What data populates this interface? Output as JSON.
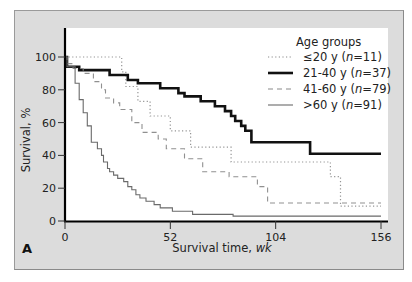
{
  "chart_data": {
    "type": "line",
    "subtype": "kaplan-meier step",
    "panel_label": "A",
    "title": "",
    "xlabel": "Survival time, ",
    "xlabel_unit": "wk",
    "ylabel": "Survival, %",
    "xlim": [
      0,
      156
    ],
    "ylim": [
      0,
      100
    ],
    "x_ticks": [
      0,
      52,
      104,
      156
    ],
    "y_ticks": [
      0,
      20,
      40,
      60,
      80,
      100
    ],
    "grid": false,
    "legend": {
      "title": "Age groups",
      "position": "upper right",
      "entries": [
        {
          "prefix": "≤20 y (",
          "n_label": "n",
          "suffix": "=11)",
          "style": "dotted"
        },
        {
          "prefix": "21-40 y (",
          "n_label": "n",
          "suffix": "=37)",
          "style": "thick-solid"
        },
        {
          "prefix": "41-60 y (",
          "n_label": "n",
          "suffix": "=79)",
          "style": "dashed"
        },
        {
          "prefix": ">60 y (",
          "n_label": "n",
          "suffix": "=91)",
          "style": "thin-solid"
        }
      ]
    },
    "series": [
      {
        "name": "≤20 y (n=11)",
        "style": "dotted",
        "color": "#8a8a8a",
        "x": [
          0,
          2,
          2,
          28,
          28,
          30,
          30,
          36,
          36,
          42,
          42,
          52,
          52,
          62,
          62,
          82,
          82,
          131,
          131,
          136,
          136,
          156
        ],
        "y": [
          100,
          100,
          100,
          100,
          91,
          91,
          82,
          82,
          73,
          73,
          64,
          64,
          55,
          55,
          45,
          45,
          36,
          36,
          27,
          27,
          9,
          9
        ]
      },
      {
        "name": "21-40 y (n=37)",
        "style": "thick-solid",
        "color": "#111111",
        "x": [
          0,
          1,
          1,
          7,
          7,
          22,
          22,
          31,
          31,
          36,
          36,
          47,
          47,
          56,
          56,
          59,
          59,
          67,
          67,
          74,
          74,
          79,
          79,
          82,
          82,
          84,
          84,
          87,
          87,
          89,
          89,
          92,
          92,
          106,
          106,
          121,
          121,
          156
        ],
        "y": [
          100,
          100,
          94,
          94,
          92,
          92,
          89,
          89,
          86,
          86,
          84,
          84,
          81,
          81,
          78,
          78,
          76,
          76,
          73,
          73,
          70,
          70,
          67,
          67,
          64,
          64,
          61,
          61,
          58,
          58,
          55,
          55,
          48,
          48,
          48,
          48,
          41,
          41
        ]
      },
      {
        "name": "41-60 y (n=79)",
        "style": "dashed",
        "color": "#8a8a8a",
        "x": [
          0,
          1,
          1,
          4,
          4,
          9,
          9,
          14,
          14,
          18,
          18,
          20,
          20,
          24,
          24,
          27,
          27,
          33,
          33,
          38,
          38,
          46,
          46,
          50,
          50,
          59,
          59,
          68,
          68,
          81,
          81,
          95,
          95,
          100,
          100,
          156
        ],
        "y": [
          100,
          100,
          96,
          96,
          93,
          93,
          90,
          90,
          85,
          85,
          80,
          80,
          75,
          75,
          72,
          72,
          68,
          68,
          60,
          60,
          54,
          54,
          50,
          50,
          44,
          44,
          38,
          38,
          30,
          30,
          27,
          27,
          21,
          21,
          11,
          11
        ]
      },
      {
        "name": ">60 y (n=91)",
        "style": "thin-solid",
        "color": "#6a6a6a",
        "x": [
          0,
          1,
          1,
          5,
          5,
          7,
          7,
          9,
          9,
          11,
          11,
          13,
          13,
          16,
          16,
          18,
          18,
          19,
          19,
          21,
          21,
          22,
          22,
          24,
          24,
          26,
          26,
          29,
          29,
          31,
          31,
          33,
          33,
          35,
          35,
          37,
          37,
          40,
          40,
          44,
          44,
          47,
          47,
          53,
          53,
          63,
          63,
          83,
          83,
          156
        ],
        "y": [
          100,
          100,
          94,
          94,
          84,
          84,
          74,
          74,
          66,
          66,
          58,
          58,
          48,
          48,
          44,
          44,
          40,
          40,
          36,
          36,
          32,
          32,
          30,
          30,
          28,
          28,
          26,
          26,
          24,
          24,
          21,
          21,
          19,
          19,
          16,
          16,
          14,
          14,
          12,
          12,
          10,
          10,
          8,
          8,
          6,
          6,
          4,
          4,
          3,
          3
        ]
      }
    ]
  }
}
